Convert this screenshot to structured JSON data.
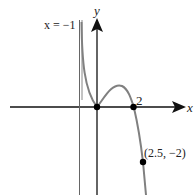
{
  "figure": {
    "type": "function-graph",
    "labels": {
      "asymptote": "x = −1",
      "x_axis": "x",
      "y_axis": "y",
      "x_intercept": "2",
      "point": "(2.5, −2)"
    },
    "asymptote_x": -1,
    "points": [
      {
        "x": 0,
        "y": 0
      },
      {
        "x": 2,
        "y": 0
      },
      {
        "x": 2.5,
        "y": -2
      }
    ],
    "colors": {
      "curve": "#808080",
      "axes": "#111111",
      "asymptote": "#666666",
      "points": "#000000"
    }
  }
}
